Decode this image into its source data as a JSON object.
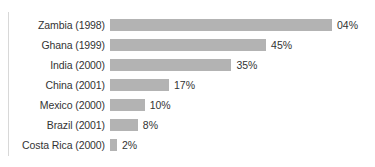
{
  "chart_data": {
    "type": "bar",
    "orientation": "horizontal",
    "title": "",
    "xlabel": "",
    "ylabel": "",
    "grid": false,
    "legend": false,
    "xlim": [
      0,
      70
    ],
    "categories": [
      "Zambia (1998)",
      "Ghana (1999)",
      "India (2000)",
      "China (2001)",
      "Mexico (2000)",
      "Brazil (2001)",
      "Costa Rica (2000)"
    ],
    "values": [
      64,
      45,
      35,
      17,
      10,
      8,
      2
    ],
    "value_labels": [
      "04%",
      "45%",
      "35%",
      "17%",
      "10%",
      "8%",
      "2%"
    ],
    "bar_color": "#b3b3b3",
    "text_color": "#333333",
    "background": "#ffffff",
    "bars": [
      {
        "label": "Zambia (1998)",
        "value": 64,
        "value_label": "04%"
      },
      {
        "label": "Ghana (1999)",
        "value": 45,
        "value_label": "45%"
      },
      {
        "label": "India (2000)",
        "value": 35,
        "value_label": "35%"
      },
      {
        "label": "China (2001)",
        "value": 17,
        "value_label": "17%"
      },
      {
        "label": "Mexico (2000)",
        "value": 10,
        "value_label": "10%"
      },
      {
        "label": "Brazil (2001)",
        "value": 8,
        "value_label": "8%"
      },
      {
        "label": "Costa Rica (2000)",
        "value": 2,
        "value_label": "2%"
      }
    ]
  }
}
